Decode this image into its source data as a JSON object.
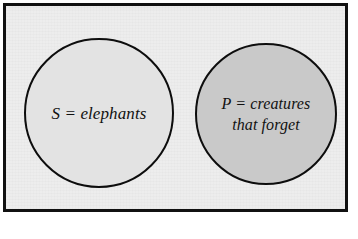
{
  "diagram": {
    "type": "euler-venn-two-disjoint-sets",
    "frame": {
      "name": "universe-box",
      "background_color": "#ededed",
      "border_color": "#111111"
    },
    "circles": [
      {
        "id": "subject",
        "symbol": "S",
        "label_full": "S = elephants",
        "lines": [
          "S = elephants"
        ],
        "fill_color": "#e3e3e3",
        "stroke_color": "#0d0d0d"
      },
      {
        "id": "predicate",
        "symbol": "P",
        "label_full": "P = creatures that forget",
        "lines": [
          "P = creatures",
          "that forget"
        ],
        "fill_color": "#c9c9c9",
        "stroke_color": "#0d0d0d"
      }
    ]
  }
}
